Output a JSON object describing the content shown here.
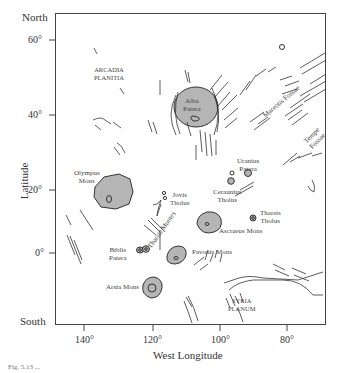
{
  "map": {
    "y_axis": {
      "title": "Latitude",
      "top_label": "North",
      "bottom_label": "South",
      "ticks": [
        "60°",
        "40°",
        "20°",
        "0°"
      ]
    },
    "x_axis": {
      "title": "West Longitude",
      "ticks": [
        "140°",
        "120°",
        "100°",
        "80°"
      ]
    },
    "regions": {
      "arcadia": [
        "ARCADIA",
        "PLANITIA"
      ],
      "syria": [
        "SYRIA",
        "PLANUM"
      ]
    },
    "features": {
      "alba": [
        "Alba",
        "Patera"
      ],
      "olympus": [
        "Olympus",
        "Mons"
      ],
      "jovis": [
        "Jovis",
        "Tholus"
      ],
      "uranius": [
        "Uranius",
        "Patera"
      ],
      "ceraunius": [
        "Ceraunius",
        "Tholus"
      ],
      "tharsis_tholus": [
        "Tharsis",
        "Tholus"
      ],
      "ascraeus": "Ascraeus Mons",
      "pavonis": "Pavonis Mons",
      "biblis": [
        "Biblis",
        "Patera"
      ],
      "arsia": "Arsia Mons",
      "tharsis_montes": "Tharsis Montes",
      "mareotis": "Mareotis Fossae",
      "tempe": [
        "Tempe",
        "Fossae"
      ]
    },
    "colors": {
      "volcano_fill": "#b5b5b5",
      "line": "#333333"
    }
  },
  "caption": "Fig. 5.13 ..."
}
